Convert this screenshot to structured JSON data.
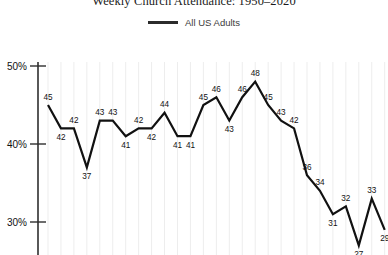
{
  "chart_data": {
    "type": "line",
    "title": "Weekly Church Attendance: 1950–2020",
    "xlabel": "",
    "ylabel": "",
    "ylim": [
      25,
      50
    ],
    "ytick_labels": [
      "50%",
      "40%",
      "30%"
    ],
    "ytick_values": [
      50,
      40,
      30
    ],
    "grid": "vertical-only",
    "legend_position": "top-center",
    "legend": [
      "All US Adults"
    ],
    "series": [
      {
        "name": "All US Adults",
        "color": "#111111",
        "values": [
          45,
          42,
          42,
          37,
          43,
          43,
          41,
          42,
          42,
          44,
          41,
          41,
          45,
          46,
          43,
          46,
          48,
          45,
          43,
          42,
          36,
          34,
          31,
          32,
          27,
          33,
          29
        ]
      }
    ],
    "point_labels": [
      "45",
      "42",
      "42",
      "37",
      "43",
      "43",
      "41",
      "42",
      "42",
      "44",
      "41",
      "41",
      "45",
      "46",
      "43",
      "46",
      "48",
      "45",
      "43",
      "42",
      "36",
      "34",
      "31",
      "32",
      "27",
      "33",
      "29"
    ]
  },
  "legend": {
    "line_icon": "legend-line-icon",
    "label": "All US Adults"
  },
  "title": "Weekly Church Attendance: 1950–2020",
  "axis": {
    "y_labels": [
      "50%",
      "40%",
      "30%"
    ]
  }
}
